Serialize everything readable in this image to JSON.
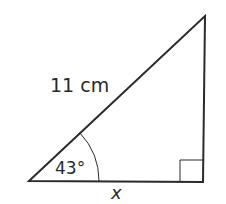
{
  "diagram": {
    "type": "right-triangle",
    "hypotenuse_label": "11 cm",
    "angle_label": "43°",
    "base_label": "x",
    "right_angle_marker": true,
    "stroke_color": "#2a2a2a"
  }
}
